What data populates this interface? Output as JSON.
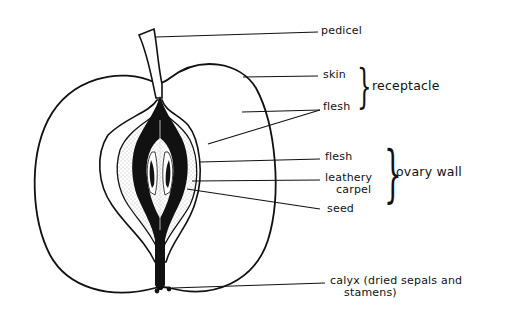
{
  "diagram": {
    "labels": {
      "pedicel": "pedicel",
      "skin": "skin",
      "flesh_outer": "flesh",
      "receptacle": "receptacle",
      "flesh_inner": "flesh",
      "leathery_carpel_1": "leathery",
      "leathery_carpel_2": "carpel",
      "ovary_wall": "ovary wall",
      "seed": "seed",
      "calyx_1": "calyx (dried sepals and",
      "calyx_2": "stamens)"
    },
    "groups": [
      {
        "name": "receptacle",
        "members": [
          "skin",
          "flesh"
        ]
      },
      {
        "name": "ovary wall",
        "members": [
          "flesh",
          "leathery carpel"
        ]
      }
    ],
    "colors": {
      "ink": "#111111",
      "background": "#ffffff",
      "stipple": "#777777"
    }
  }
}
